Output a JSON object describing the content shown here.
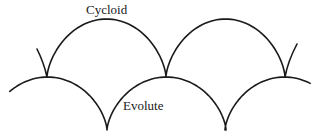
{
  "labels": {
    "cycloid": "Cycloid",
    "evolute": "Evolute"
  },
  "colors": {
    "stroke": "#1a1a1a",
    "background": "#ffffff"
  },
  "geometry": {
    "cycloid": {
      "cusps_x": [
        47,
        166,
        285
      ],
      "base_y": 77,
      "top_y": 19,
      "stub_left": {
        "from_x": 47,
        "to_x": 37,
        "to_y": 49
      },
      "stub_right": {
        "from_x": 285,
        "to_x": 297,
        "to_y": 44
      }
    },
    "evolute": {
      "peaks_x": [
        47,
        166,
        285
      ],
      "peak_y": 77,
      "bottom_y": 130,
      "bottoms_x": [
        107,
        225
      ],
      "left_end": {
        "x": 8,
        "y": 95
      },
      "right_end": {
        "x": 312,
        "y": 86
      }
    }
  }
}
